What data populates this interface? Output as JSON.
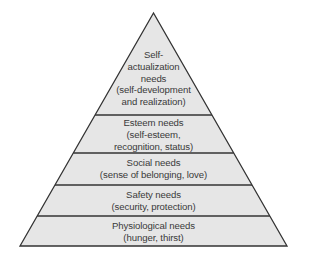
{
  "diagram": {
    "type": "pyramid",
    "colors": {
      "fill": "#e6e6e6",
      "stroke": "#333333",
      "text": "#3a3a3a",
      "background": "#ffffff"
    },
    "levels": [
      {
        "name": "Self-actualization needs",
        "lines": [
          "Self-",
          "actualization",
          "needs",
          "(self-development",
          "and realization)"
        ]
      },
      {
        "name": "Esteem needs",
        "lines": [
          "Esteem needs",
          "(self-esteem,",
          "recognition, status)"
        ]
      },
      {
        "name": "Social needs",
        "lines": [
          "Social needs",
          "(sense of belonging, love)"
        ]
      },
      {
        "name": "Safety needs",
        "lines": [
          "Safety needs",
          "(security, protection)"
        ]
      },
      {
        "name": "Physiological needs",
        "lines": [
          "Physiological needs",
          "(hunger, thirst)"
        ]
      }
    ]
  }
}
